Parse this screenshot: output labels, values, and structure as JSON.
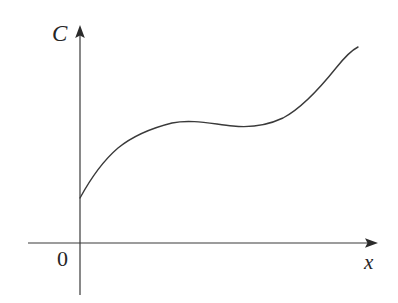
{
  "figure": {
    "width": 398,
    "height": 303,
    "background_color": "#ffffff",
    "ink_color": "#3a3a3a",
    "text_color": "#262626"
  },
  "labels": {
    "y_axis": "C",
    "x_axis": "x",
    "origin": "0"
  },
  "icons": {
    "y_axis_arrowhead": "arrow-up-icon",
    "x_axis_arrowhead": "arrow-right-icon"
  },
  "chart_data": {
    "type": "line",
    "title": "",
    "xlabel": "x",
    "ylabel": "C",
    "grid": false,
    "legend": false,
    "axis_origin_label": "0",
    "xlim": [
      0,
      1
    ],
    "ylim": [
      0,
      1
    ],
    "series": [
      {
        "name": "C(x)",
        "color": "#3a3a3a",
        "line_width": 1.4,
        "x": [
          0.0,
          0.04,
          0.09,
          0.15,
          0.22,
          0.3,
          0.39,
          0.48,
          0.57,
          0.66,
          0.74,
          0.82,
          0.89,
          0.95,
          1.0
        ],
        "y": [
          0.21,
          0.3,
          0.38,
          0.45,
          0.51,
          0.55,
          0.58,
          0.6,
          0.62,
          0.65,
          0.7,
          0.77,
          0.85,
          0.92,
          0.99
        ]
      }
    ],
    "annotations": [
      {
        "name": "y-intercept",
        "x": 0.0,
        "y": 0.21
      },
      {
        "name": "plateau-start",
        "x": 0.37,
        "y": 0.575
      },
      {
        "name": "plateau-end",
        "x": 0.56,
        "y": 0.615
      },
      {
        "name": "curve-end",
        "x": 1.0,
        "y": 0.99
      }
    ]
  },
  "geometry": {
    "y_axis_x": 80,
    "x_axis_y": 243,
    "y_axis_top": 28,
    "y_axis_bottom": 295,
    "x_axis_left": 28,
    "x_axis_right": 378,
    "curve_path": "M 80,198 C 92,176 104,160 118,148 C 134,135 152,128 172,123 C 192,119 212,124 233,126 C 252,128 268,125 283,118 C 302,108 320,88 336,68 C 344,58 352,50 358,47"
  }
}
